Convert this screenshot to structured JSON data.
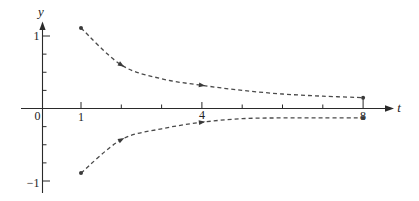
{
  "chart_data": {
    "type": "line",
    "title": "",
    "xlabel": "t",
    "ylabel": "y",
    "xlim": [
      0,
      8.7
    ],
    "ylim": [
      -1.15,
      1.2
    ],
    "grid": false,
    "legend": null,
    "x_ticks": [
      1,
      2,
      3,
      4,
      5,
      6,
      7,
      8
    ],
    "x_tick_labels": {
      "0": "0",
      "1": "1",
      "4": "4",
      "8": "8"
    },
    "y_ticks": [
      -1,
      -0.75,
      -0.5,
      -0.25,
      0.25,
      0.5,
      0.75,
      1
    ],
    "y_tick_labels": {
      "1": "1",
      "-1": "−1"
    },
    "x": [
      1,
      2,
      3,
      4,
      5,
      6,
      7,
      8
    ],
    "series": [
      {
        "name": "upper trajectory",
        "style": "dashed",
        "values": [
          1.11,
          0.6,
          0.41,
          0.32,
          0.25,
          0.2,
          0.17,
          0.15
        ],
        "endpoint_dots": [
          1,
          8
        ],
        "arrow_markers": [
          2,
          4
        ]
      },
      {
        "name": "lower trajectory",
        "style": "dashed",
        "values": [
          -0.89,
          -0.43,
          -0.28,
          -0.19,
          -0.14,
          -0.13,
          -0.13,
          -0.13
        ],
        "endpoint_dots": [
          1,
          8
        ],
        "arrow_markers": [
          2,
          4
        ]
      }
    ]
  },
  "labels": {
    "y_axis": "y",
    "t_axis": "t",
    "origin": "0",
    "x1": "1",
    "x4": "4",
    "x8": "8",
    "y1": "1",
    "yneg1": "−1"
  },
  "colors": {
    "axis": "#2a2a2a",
    "curve": "#4a4a4a",
    "background": "#ffffff"
  }
}
